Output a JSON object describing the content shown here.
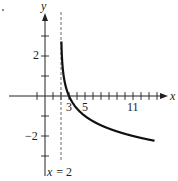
{
  "chart_data": {
    "type": "line",
    "title": "",
    "xlabel": "x",
    "ylabel": "y",
    "function": "y = -log_3(x - 2)",
    "asymptote": {
      "x": 2,
      "label": "x = 2",
      "style": "dashed"
    },
    "xlim": [
      -5,
      15
    ],
    "ylim": [
      -3.5,
      4
    ],
    "x_ticks": [
      -1,
      1,
      2,
      3,
      4,
      5,
      6,
      7,
      8,
      9,
      10,
      11,
      12,
      13,
      14
    ],
    "x_tick_labels": [
      {
        "value": 3,
        "label": "3"
      },
      {
        "value": 5,
        "label": "5"
      },
      {
        "value": 11,
        "label": "11"
      }
    ],
    "y_ticks": [
      -3,
      -2,
      -1,
      1,
      2,
      3
    ],
    "y_tick_labels": [
      {
        "value": 2,
        "label": "2"
      },
      {
        "value": -2,
        "label": "−2"
      }
    ],
    "series": [
      {
        "name": "curve",
        "x": [
          2.03,
          2.1,
          2.3,
          2.6,
          3,
          3.5,
          4,
          5,
          6,
          7,
          8,
          9,
          10,
          11,
          12,
          13,
          13.7
        ],
        "y": [
          3.19,
          2.1,
          1.35,
          0.81,
          0.0,
          -0.37,
          -0.63,
          -1.0,
          -1.26,
          -1.46,
          -1.63,
          -1.77,
          -1.89,
          -2.0,
          -2.1,
          -2.18,
          -2.24
        ]
      }
    ],
    "grid": false,
    "legend": null
  },
  "labels": {
    "x_axis": "x",
    "y_axis": "y",
    "asymptote": "x = 2",
    "tick_3": "3",
    "tick_5": "5",
    "tick_11": "11",
    "tick_y2": "2",
    "tick_yneg2": "−2"
  }
}
